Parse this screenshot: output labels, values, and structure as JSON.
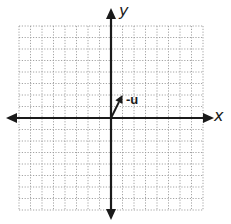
{
  "diagram": {
    "type": "coordinate-plane",
    "grid": {
      "cells_x": 16,
      "cells_y": 16,
      "x_range": [
        -8,
        8
      ],
      "y_range": [
        -8,
        8
      ],
      "style": "dotted"
    },
    "axes": {
      "x_label": "x",
      "y_label": "y"
    },
    "vectors": [
      {
        "label": "-u",
        "from": [
          0,
          0
        ],
        "to": [
          1,
          2
        ]
      }
    ],
    "colors": {
      "axis": "#1a1a1a",
      "grid": "#9a9a9a",
      "background": "#ffffff"
    }
  }
}
